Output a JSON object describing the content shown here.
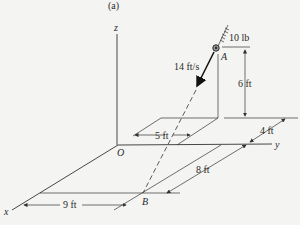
{
  "figure": {
    "panel_label": "(a)",
    "axes": {
      "x": "x",
      "y": "y",
      "z": "z",
      "origin": "O"
    },
    "points": {
      "A": "A",
      "B": "B"
    },
    "labels": {
      "weight": "10 lb",
      "velocity": "14 ft/s",
      "height": "6 ft",
      "dim_5": "5 ft",
      "dim_4": "4 ft",
      "dim_8": "8 ft",
      "dim_9": "9 ft"
    },
    "colors": {
      "ink": "#333333",
      "background": "#f4f4f2"
    }
  }
}
